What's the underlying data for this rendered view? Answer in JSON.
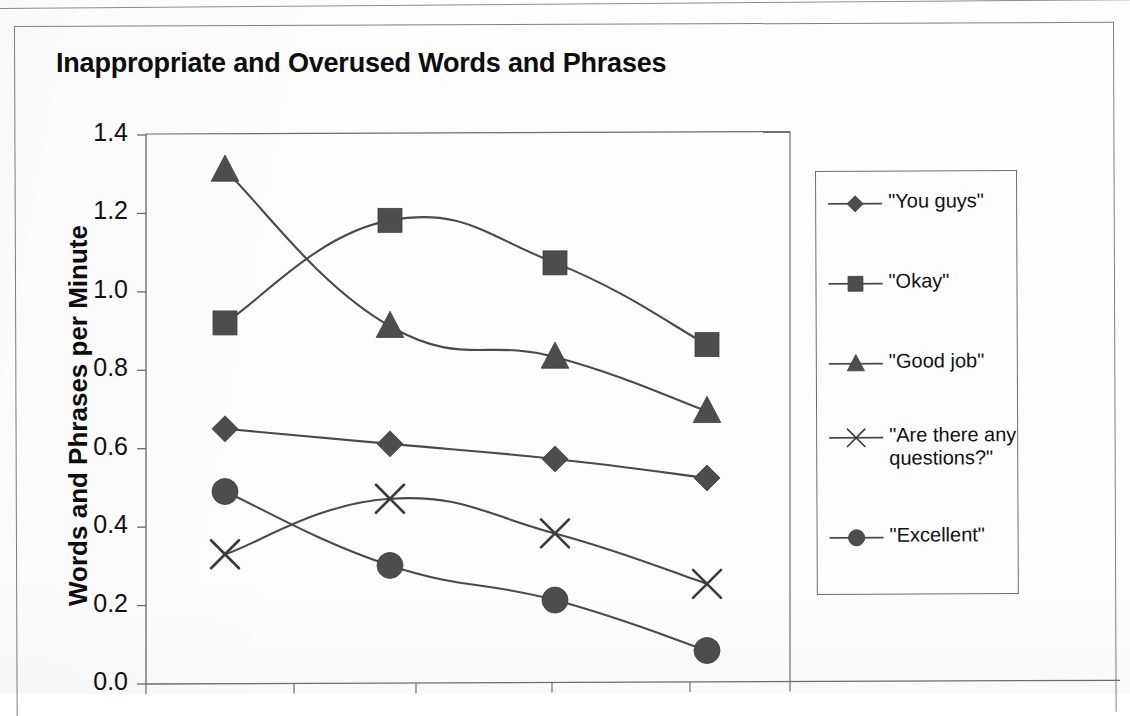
{
  "document": {
    "type": "scanned-chart-figure"
  },
  "chart_data": {
    "type": "line",
    "title": "Inappropriate and Overused Words and Phrases",
    "xlabel": "",
    "ylabel": "Words and Phrases per Minute",
    "ylim": [
      0.0,
      1.4
    ],
    "ytick_labels": [
      "1.4",
      "1.2",
      "1.0",
      "0.8",
      "0.6",
      "0.4",
      "0.2",
      "0.0"
    ],
    "ytick_values": [
      1.4,
      1.2,
      1.0,
      0.8,
      0.6,
      0.4,
      0.2,
      0.0
    ],
    "grid": false,
    "legend_position": "right",
    "x": [
      1,
      2,
      3,
      4
    ],
    "xtick_labels": [
      "",
      "",
      "",
      ""
    ],
    "series": [
      {
        "name": "\"You guys\"",
        "marker": "diamond",
        "color": "#4d4d4d",
        "values": [
          0.65,
          0.61,
          0.57,
          0.52
        ]
      },
      {
        "name": "\"Okay\"",
        "marker": "square",
        "color": "#4d4d4d",
        "values": [
          0.92,
          1.18,
          1.07,
          0.86
        ]
      },
      {
        "name": "\"Good job\"",
        "marker": "triangle",
        "color": "#4d4d4d",
        "values": [
          1.31,
          0.91,
          0.83,
          0.69
        ]
      },
      {
        "name": "\"Are there any\nquestions?\"",
        "marker": "x",
        "color": "#3a3a3a",
        "values": [
          0.33,
          0.47,
          0.38,
          0.25
        ]
      },
      {
        "name": "\"Excellent\"",
        "marker": "circle",
        "color": "#4d4d4d",
        "values": [
          0.49,
          0.3,
          0.21,
          0.08
        ]
      }
    ]
  },
  "legend": {
    "items": [
      {
        "label": "\"You guys\"",
        "marker": "diamond"
      },
      {
        "label": "\"Okay\"",
        "marker": "square"
      },
      {
        "label": "\"Good job\"",
        "marker": "triangle"
      },
      {
        "label": "\"Are there any\nquestions?\"",
        "marker": "x"
      },
      {
        "label": "\"Excellent\"",
        "marker": "circle"
      }
    ]
  },
  "colors": {
    "ink": "#1a1a1a",
    "marker_fill": "#4d4d4d",
    "axis_line": "#6e6e6e",
    "frame": "#7f7f7f",
    "page": "#fdfdfd"
  }
}
